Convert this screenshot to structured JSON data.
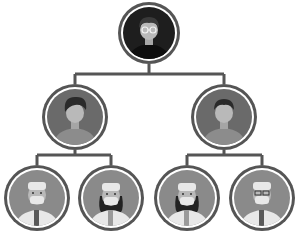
{
  "diagram": {
    "type": "org-chart",
    "colors": {
      "line": "#555555",
      "ring": "#555555",
      "ring_gap": "#ffffff",
      "top_bg": "#1e1e1e",
      "mid_bg": "#6a6a6a",
      "bottom_bg": "#8a8a8a",
      "skin": "#b9b9b9",
      "hair_dark": "#2a2a2a",
      "coat": "#e8e8e8",
      "tie": "#5a5a5a"
    },
    "nodes": [
      {
        "id": "top",
        "role": "manager-icon",
        "cx": 149,
        "cy": 33,
        "r": 31,
        "level": 0
      },
      {
        "id": "mid-left",
        "role": "team-lead-icon",
        "cx": 75,
        "cy": 117,
        "r": 33,
        "level": 1
      },
      {
        "id": "mid-right",
        "role": "team-lead-icon",
        "cx": 224,
        "cy": 117,
        "r": 33,
        "level": 1
      },
      {
        "id": "bottom-1",
        "role": "doctor-male-icon",
        "cx": 37,
        "cy": 198,
        "r": 33,
        "level": 2
      },
      {
        "id": "bottom-2",
        "role": "doctor-female-icon",
        "cx": 111,
        "cy": 198,
        "r": 33,
        "level": 2
      },
      {
        "id": "bottom-3",
        "role": "doctor-female-icon",
        "cx": 187,
        "cy": 198,
        "r": 33,
        "level": 2
      },
      {
        "id": "bottom-4",
        "role": "doctor-male-icon",
        "cx": 262,
        "cy": 198,
        "r": 33,
        "level": 2
      }
    ]
  }
}
